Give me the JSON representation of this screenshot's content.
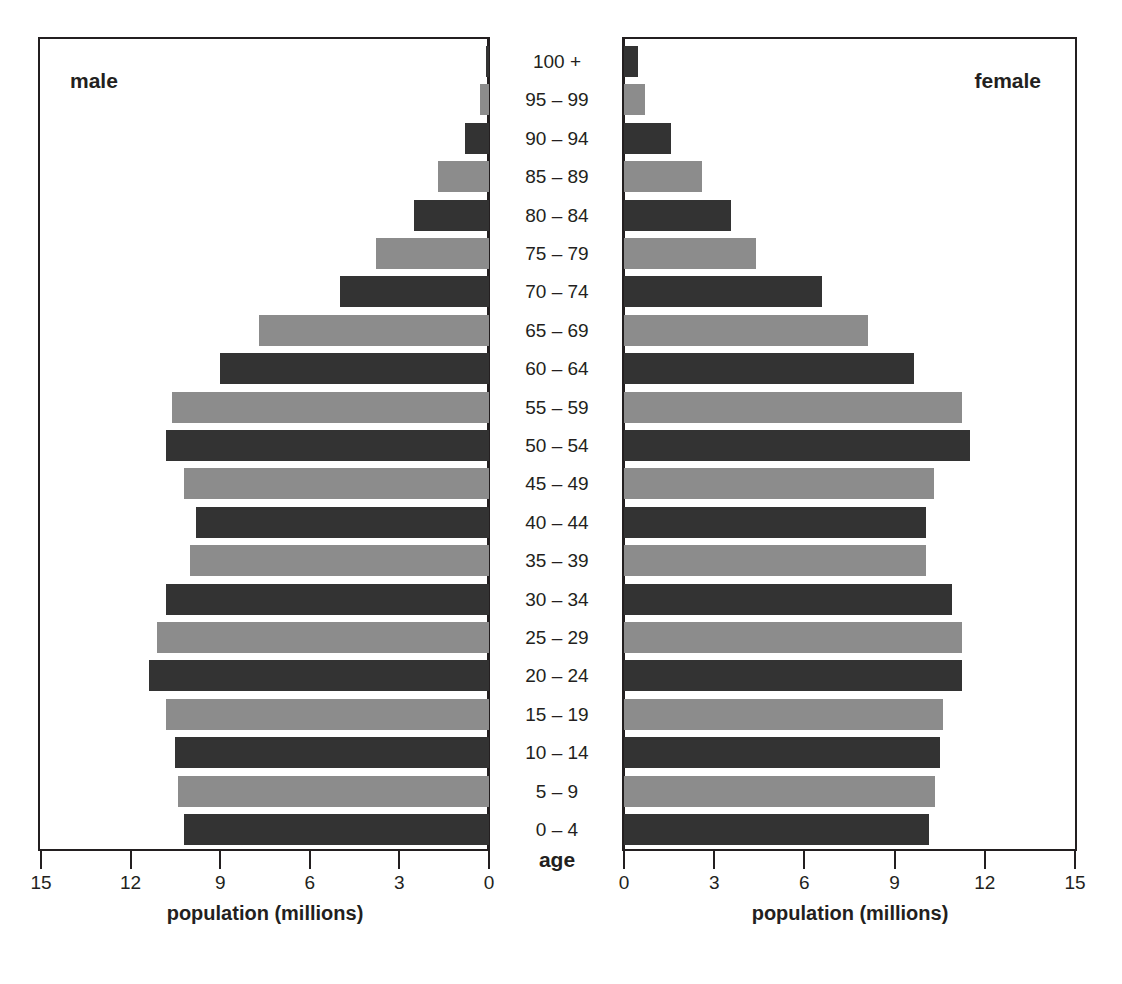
{
  "chart_data": {
    "type": "bar",
    "subtype": "population_pyramid",
    "title": "",
    "categories": [
      "100 +",
      "95 – 99",
      "90 – 94",
      "85 – 89",
      "80 – 84",
      "75 – 79",
      "70 – 74",
      "65 – 69",
      "60 – 64",
      "55 – 59",
      "50 – 54",
      "45 – 49",
      "40 – 44",
      "35 – 39",
      "30 – 34",
      "25 – 29",
      "20 – 24",
      "15 – 19",
      "10 – 14",
      "5 – 9",
      "0 – 4"
    ],
    "series": [
      {
        "name": "male",
        "values": [
          0.1,
          0.3,
          0.8,
          1.7,
          2.5,
          3.8,
          5.0,
          7.7,
          9.0,
          10.6,
          10.8,
          10.2,
          9.8,
          10.0,
          10.8,
          11.1,
          11.4,
          10.8,
          10.5,
          10.4,
          10.2
        ]
      },
      {
        "name": "female",
        "values": [
          0.45,
          0.7,
          1.55,
          2.6,
          3.55,
          4.4,
          6.6,
          8.1,
          9.65,
          11.25,
          11.5,
          10.3,
          10.05,
          10.05,
          10.9,
          11.25,
          11.25,
          10.6,
          10.5,
          10.35,
          10.15
        ]
      }
    ],
    "xlabel": "population (millions)",
    "ylabel": "age",
    "xlim": [
      0,
      15
    ],
    "xticks": [
      0,
      3,
      6,
      9,
      12,
      15
    ],
    "grid": false,
    "legend": "panel titles (male left, female right)",
    "bar_colors_alternating": [
      "#333333",
      "#8c8c8c"
    ]
  },
  "panels": {
    "male_title": "male",
    "female_title": "female"
  },
  "axis": {
    "age_title": "age",
    "x_title": "population (millions)",
    "male_ticks": [
      "15",
      "12",
      "9",
      "6",
      "3",
      "0"
    ],
    "female_ticks": [
      "0",
      "3",
      "6",
      "9",
      "12",
      "15"
    ]
  }
}
